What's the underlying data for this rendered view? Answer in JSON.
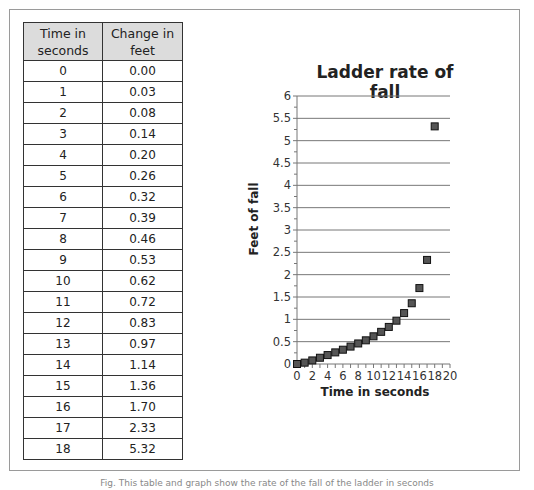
{
  "table": {
    "headers": [
      "Time in seconds",
      "Change in feet"
    ],
    "rows": [
      [
        "0",
        "0.00"
      ],
      [
        "1",
        "0.03"
      ],
      [
        "2",
        "0.08"
      ],
      [
        "3",
        "0.14"
      ],
      [
        "4",
        "0.20"
      ],
      [
        "5",
        "0.26"
      ],
      [
        "6",
        "0.32"
      ],
      [
        "7",
        "0.39"
      ],
      [
        "8",
        "0.46"
      ],
      [
        "9",
        "0.53"
      ],
      [
        "10",
        "0.62"
      ],
      [
        "11",
        "0.72"
      ],
      [
        "12",
        "0.83"
      ],
      [
        "13",
        "0.97"
      ],
      [
        "14",
        "1.14"
      ],
      [
        "15",
        "1.36"
      ],
      [
        "16",
        "1.70"
      ],
      [
        "17",
        "2.33"
      ],
      [
        "18",
        "5.32"
      ]
    ]
  },
  "caption": "Fig. This table and graph show the rate of the fall of the ladder in seconds",
  "chart_data": {
    "type": "scatter",
    "title": "Ladder rate of fall",
    "xlabel": "Time in seconds",
    "ylabel": "Feet of fall",
    "x": [
      0,
      1,
      2,
      3,
      4,
      5,
      6,
      7,
      8,
      9,
      10,
      11,
      12,
      13,
      14,
      15,
      16,
      17,
      18
    ],
    "values": [
      0.0,
      0.03,
      0.08,
      0.14,
      0.2,
      0.26,
      0.32,
      0.39,
      0.46,
      0.53,
      0.62,
      0.72,
      0.83,
      0.97,
      1.14,
      1.36,
      1.7,
      2.33,
      5.32
    ],
    "xlim": [
      0,
      20
    ],
    "ylim": [
      0,
      6
    ],
    "xticks": [
      "0",
      "2",
      "4",
      "6",
      "8",
      "10",
      "12",
      "14",
      "16",
      "18",
      "20"
    ],
    "yticks": [
      "0",
      "0.5",
      "1",
      "1.5",
      "2",
      "2.5",
      "3",
      "3.5",
      "4",
      "4.5",
      "5",
      "5.5",
      "6"
    ],
    "grid": "horizontal",
    "legend": "none",
    "marker_color": "#555555"
  }
}
